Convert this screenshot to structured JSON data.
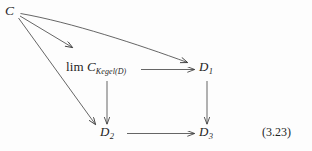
{
  "figure": {
    "kind": "commutative-diagram",
    "equation_number": "(3.23)",
    "background_color": "#fdfdfd",
    "ink_color": "#1f1f1f",
    "nodes": {
      "source": {
        "label": "C"
      },
      "limit": {
        "operator": "lim",
        "object": "C",
        "subscript": "Kegel(D)"
      },
      "d1": {
        "base": "D",
        "index": "1"
      },
      "d2": {
        "base": "D",
        "index": "2"
      },
      "d3": {
        "base": "D",
        "index": "3"
      }
    },
    "arrows": [
      {
        "name": "c-to-limit",
        "from": "C",
        "to": "lim C_Kegel(D)",
        "style": "straight"
      },
      {
        "name": "c-to-d1",
        "from": "C",
        "to": "D1",
        "style": "curved"
      },
      {
        "name": "c-to-d2",
        "from": "C",
        "to": "D2",
        "style": "straight"
      },
      {
        "name": "limit-to-d1",
        "from": "lim C_Kegel(D)",
        "to": "D1",
        "style": "straight"
      },
      {
        "name": "limit-to-d2",
        "from": "lim C_Kegel(D)",
        "to": "D2",
        "style": "straight"
      },
      {
        "name": "d1-to-d3",
        "from": "D1",
        "to": "D3",
        "style": "straight"
      },
      {
        "name": "d2-to-d3",
        "from": "D2",
        "to": "D3",
        "style": "straight"
      }
    ]
  }
}
